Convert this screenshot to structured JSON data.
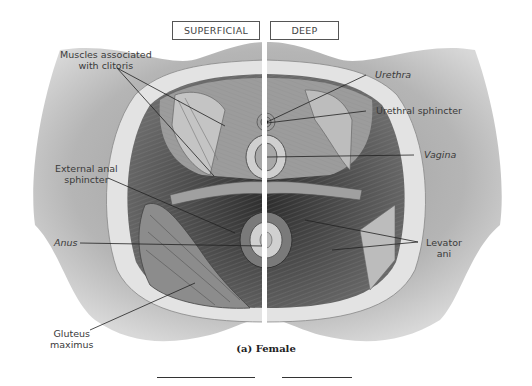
{
  "figure": {
    "view_tabs": [
      {
        "label": "SUPERFICIAL"
      },
      {
        "label": "DEEP"
      }
    ],
    "caption": "(a) Female",
    "labels": {
      "muscles_clitoris": [
        "Muscles associated",
        "with clitoris"
      ],
      "external_anal_sphincter": [
        "External anal",
        "sphincter"
      ],
      "anus": "Anus",
      "gluteus_maximus": [
        "Gluteus",
        "maximus"
      ],
      "urethra": "Urethra",
      "urethral_sphincter": "Urethral sphincter",
      "vagina": "Vagina",
      "levator_ani": [
        "Levator",
        "ani"
      ]
    },
    "colors": {
      "skin": "#b8b8b8",
      "fat": "#e6e6e6",
      "muscle_dark": "#4a4a4a",
      "leader_line": "#222222"
    }
  }
}
